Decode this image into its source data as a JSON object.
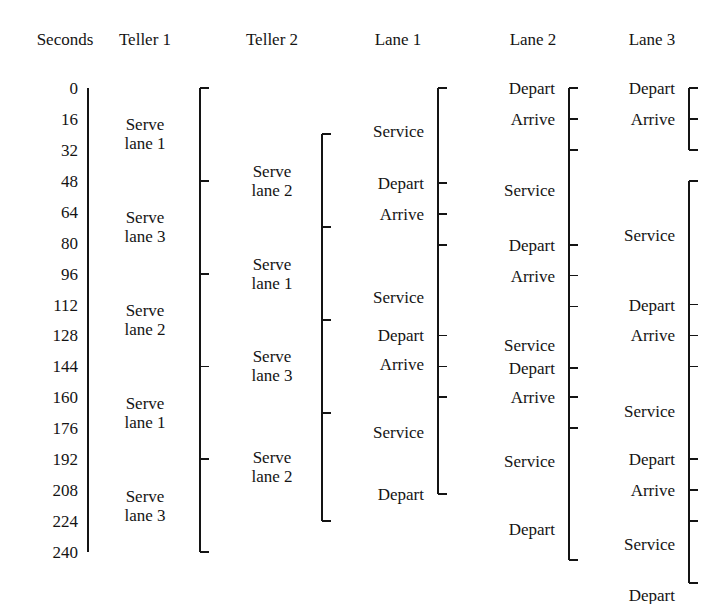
{
  "figure": {
    "axis_label": "Seconds",
    "time_unit": "seconds",
    "time_start": 0,
    "time_end": 240,
    "time_step": 16,
    "line_color": "#141414"
  },
  "axis": {
    "header": "Seconds",
    "ticks": [
      {
        "value": "0",
        "t": 0
      },
      {
        "value": "16",
        "t": 16
      },
      {
        "value": "32",
        "t": 32
      },
      {
        "value": "48",
        "t": 48
      },
      {
        "value": "64",
        "t": 64
      },
      {
        "value": "80",
        "t": 80
      },
      {
        "value": "96",
        "t": 96
      },
      {
        "value": "112",
        "t": 112
      },
      {
        "value": "128",
        "t": 128
      },
      {
        "value": "144",
        "t": 144
      },
      {
        "value": "160",
        "t": 160
      },
      {
        "value": "176",
        "t": 176
      },
      {
        "value": "192",
        "t": 192
      },
      {
        "value": "208",
        "t": 208
      },
      {
        "value": "224",
        "t": 224
      },
      {
        "value": "240",
        "t": 240
      }
    ]
  },
  "columns": [
    {
      "id": "teller-1",
      "header": "Teller 1",
      "bar_x": 200,
      "label_x": 182,
      "label_align": "ctr",
      "label_center_x": 145,
      "brackets": [
        {
          "from": 0,
          "to": 240
        }
      ],
      "ticks": [
        48,
        96,
        144,
        192
      ],
      "events": [
        {
          "line1": "Serve",
          "line2": "lane 1",
          "t": 24
        },
        {
          "line1": "Serve",
          "line2": "lane 3",
          "t": 72
        },
        {
          "line1": "Serve",
          "line2": "lane 2",
          "t": 120
        },
        {
          "line1": "Serve",
          "line2": "lane 1",
          "t": 168
        },
        {
          "line1": "Serve",
          "line2": "lane 3",
          "t": 216
        }
      ]
    },
    {
      "id": "teller-2",
      "header": "Teller 2",
      "bar_x": 322,
      "label_x": 304,
      "label_align": "ctr",
      "label_center_x": 272,
      "brackets": [
        {
          "from": 24,
          "to": 224
        }
      ],
      "ticks": [
        72,
        120,
        168
      ],
      "events": [
        {
          "line1": "Serve",
          "line2": "lane 2",
          "t": 48
        },
        {
          "line1": "Serve",
          "line2": "lane 1",
          "t": 96
        },
        {
          "line1": "Serve",
          "line2": "lane 3",
          "t": 144
        },
        {
          "line1": "Serve",
          "line2": "lane 2",
          "t": 196
        }
      ]
    },
    {
      "id": "lane-1",
      "header": "Lane 1",
      "bar_x": 438,
      "label_x": 424,
      "label_align": "right",
      "label_center_x": 398,
      "brackets": [
        {
          "from": 0,
          "to": 210
        }
      ],
      "ticks": [
        49,
        65,
        81,
        128,
        144,
        160
      ],
      "events": [
        {
          "line1": "Service",
          "t": 22
        },
        {
          "line1": "Depart",
          "t": 49
        },
        {
          "line1": "Arrive",
          "t": 65
        },
        {
          "line1": "Service",
          "t": 108
        },
        {
          "line1": "Depart",
          "t": 128
        },
        {
          "line1": "Arrive",
          "t": 143
        },
        {
          "line1": "Service",
          "t": 178
        },
        {
          "line1": "Depart",
          "t": 210
        }
      ]
    },
    {
      "id": "lane-2",
      "header": "Lane 2",
      "bar_x": 569,
      "label_x": 555,
      "label_align": "right",
      "label_center_x": 533,
      "brackets": [
        {
          "from": 0,
          "to": 244
        }
      ],
      "ticks": [
        16,
        32,
        81,
        97,
        113,
        145,
        160,
        176
      ],
      "events": [
        {
          "line1": "Depart",
          "t": 0
        },
        {
          "line1": "Arrive",
          "t": 16
        },
        {
          "line1": "Service",
          "t": 53
        },
        {
          "line1": "Depart",
          "t": 81
        },
        {
          "line1": "Arrive",
          "t": 97
        },
        {
          "line1": "Service",
          "t": 133
        },
        {
          "line1": "Depart",
          "t": 145
        },
        {
          "line1": "Arrive",
          "t": 160
        },
        {
          "line1": "Service",
          "t": 193
        },
        {
          "line1": "Depart",
          "t": 228
        }
      ]
    },
    {
      "id": "lane-3",
      "header": "Lane 3",
      "bar_x": 689,
      "label_x": 675,
      "label_align": "right",
      "label_center_x": 652,
      "brackets": [
        {
          "from": 0,
          "to": 32
        },
        {
          "from": 48,
          "to": 256
        }
      ],
      "ticks": [
        16,
        112,
        128,
        144,
        192,
        208,
        224
      ],
      "events": [
        {
          "line1": "Depart",
          "t": 0
        },
        {
          "line1": "Arrive",
          "t": 16
        },
        {
          "line1": "Service",
          "t": 76
        },
        {
          "line1": "Depart",
          "t": 112
        },
        {
          "line1": "Arrive",
          "t": 128
        },
        {
          "line1": "Service",
          "t": 167
        },
        {
          "line1": "Depart",
          "t": 192
        },
        {
          "line1": "Arrive",
          "t": 208
        },
        {
          "line1": "Service",
          "t": 236
        },
        {
          "line1": "Depart",
          "t": 262
        }
      ]
    }
  ]
}
